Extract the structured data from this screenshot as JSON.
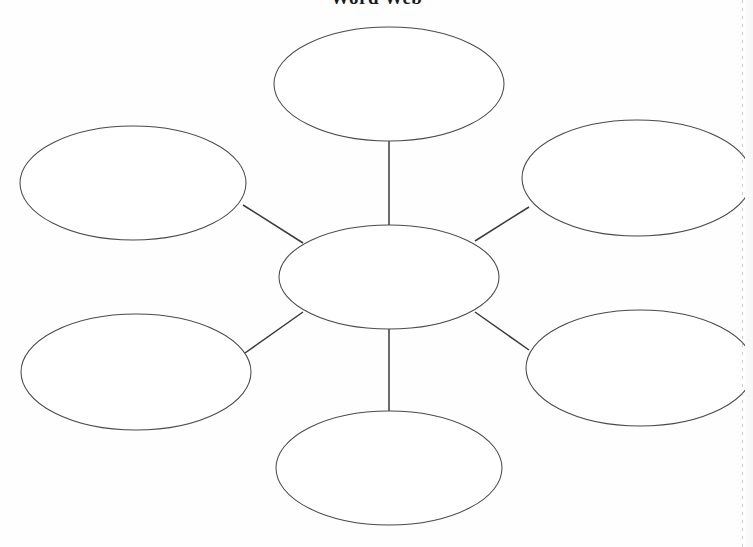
{
  "page": {
    "title": "Word Web",
    "background_color": "#ffffff",
    "width": 753,
    "height": 547
  },
  "style": {
    "node_fill": "#ffffff",
    "node_stroke": "#4a4a4a",
    "connector_stroke": "#3a3a3a"
  },
  "diagram": {
    "type": "word-web",
    "center_node": {
      "id": "center",
      "label": "",
      "cx": 389,
      "cy": 277,
      "rx": 110,
      "ry": 52
    },
    "satellite_nodes": [
      {
        "id": "top",
        "label": "",
        "cx": 389,
        "cy": 84,
        "rx": 115,
        "ry": 57
      },
      {
        "id": "upper-left",
        "label": "",
        "cx": 133,
        "cy": 183,
        "rx": 113,
        "ry": 57
      },
      {
        "id": "upper-right",
        "label": "",
        "cx": 637,
        "cy": 178,
        "rx": 115,
        "ry": 58
      },
      {
        "id": "lower-left",
        "label": "",
        "cx": 136,
        "cy": 372,
        "rx": 115,
        "ry": 58
      },
      {
        "id": "lower-right",
        "label": "",
        "cx": 640,
        "cy": 368,
        "rx": 114,
        "ry": 58
      },
      {
        "id": "bottom",
        "label": "",
        "cx": 389,
        "cy": 468,
        "rx": 113,
        "ry": 57
      }
    ],
    "connectors": [
      {
        "id": "center-to-top",
        "from": "center",
        "to": "top",
        "x1": 389,
        "y1": 225,
        "x2": 389,
        "y2": 141
      },
      {
        "id": "center-to-bottom",
        "from": "center",
        "to": "bottom",
        "x1": 389,
        "y1": 329,
        "x2": 389,
        "y2": 411
      },
      {
        "id": "center-to-upper-left",
        "from": "center",
        "to": "upper-left",
        "x1": 303,
        "y1": 243,
        "x2": 243,
        "y2": 205
      },
      {
        "id": "center-to-upper-right",
        "from": "center",
        "to": "upper-right",
        "x1": 475,
        "y1": 241,
        "x2": 529,
        "y2": 207
      },
      {
        "id": "center-to-lower-left",
        "from": "center",
        "to": "lower-left",
        "x1": 303,
        "y1": 312,
        "x2": 245,
        "y2": 353
      },
      {
        "id": "center-to-lower-right",
        "from": "center",
        "to": "lower-right",
        "x1": 475,
        "y1": 312,
        "x2": 529,
        "y2": 350
      }
    ]
  }
}
